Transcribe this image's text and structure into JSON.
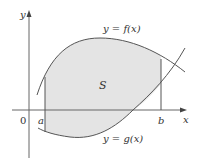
{
  "diagram": {
    "colors": {
      "fill": "#e4e4e4",
      "stroke": "#555555",
      "axis": "#666666",
      "text": "#333333"
    },
    "labels": {
      "y_axis": "y",
      "x_axis": "x",
      "origin": "0",
      "a": "a",
      "b": "b",
      "region": "S",
      "f_curve": "y = f(x)",
      "g_curve": "y = g(x)"
    }
  }
}
